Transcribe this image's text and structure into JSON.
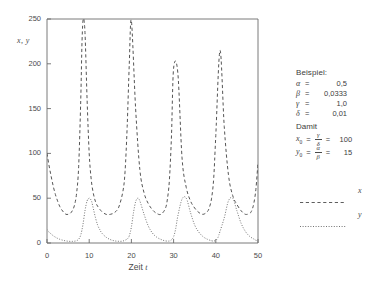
{
  "chart_data": {
    "type": "line",
    "title": "",
    "xlabel": "Zeit t",
    "ylabel": "x, y",
    "xlim": [
      0,
      50
    ],
    "ylim": [
      0,
      250
    ],
    "grid": false,
    "xticks": [
      "0",
      "10",
      "20",
      "30",
      "40",
      "50"
    ],
    "xtick_values": [
      0,
      10,
      20,
      30,
      40,
      50
    ],
    "yticks": [
      "0",
      "50",
      "100",
      "150",
      "200",
      "250"
    ],
    "ytick_values": [
      0,
      50,
      100,
      150,
      200,
      250
    ],
    "legend_position": "right-outside",
    "series": [
      {
        "name": "x",
        "style": "dashed",
        "color": "#555555",
        "description": "Beutepopulation x(t), startet bei 100, Maxima ueber 250 bei t ~ 8, 18, 28, 38, 48",
        "x": [
          0.0,
          0.5,
          1.0,
          1.5,
          2.0,
          2.5,
          3.0,
          3.5,
          4.0,
          4.5,
          5.0,
          5.5,
          6.0,
          6.5,
          7.0,
          7.5,
          8.0,
          8.3,
          8.6,
          9.0,
          9.5,
          10.0,
          10.5,
          11.0,
          11.5,
          12.0,
          13.0,
          14.0,
          15.0,
          16.0,
          17.0,
          18.0,
          18.5,
          19.0,
          19.5,
          20.0,
          21.0,
          22.0,
          23.0,
          24.0,
          25.0,
          26.0,
          27.0,
          28.0,
          28.5,
          29.0,
          29.5,
          30.0,
          31.0,
          32.0,
          33.0,
          34.0,
          35.0,
          36.0,
          37.0,
          38.0,
          38.5,
          39.0,
          39.5,
          40.0,
          41.0,
          42.0,
          43.0,
          44.0,
          45.0,
          46.0,
          47.0,
          48.0,
          48.5,
          49.0,
          49.5,
          50.0
        ],
        "y": [
          100,
          86,
          74,
          63,
          54,
          47,
          41,
          37,
          34,
          32,
          32,
          33,
          36,
          42,
          55,
          85,
          160,
          225,
          250,
          235,
          160,
          100,
          70,
          55,
          46,
          41,
          35,
          32,
          32,
          34,
          40,
          58,
          80,
          130,
          200,
          248,
          150,
          82,
          56,
          44,
          37,
          33,
          32,
          38,
          48,
          70,
          120,
          195,
          190,
          95,
          62,
          47,
          39,
          34,
          32,
          35,
          40,
          50,
          72,
          120,
          215,
          130,
          76,
          53,
          43,
          36,
          32,
          33,
          36,
          44,
          60,
          90
        ]
      },
      {
        "name": "y",
        "style": "dotted",
        "color": "#6a6a6a",
        "description": "Raeuberpopulation y(t), startet bei 15, Maxima ca. 50 bei t ~ 10, 20, 30, 40, 50",
        "x": [
          0.0,
          0.5,
          1.0,
          1.5,
          2.0,
          2.5,
          3.0,
          3.5,
          4.0,
          4.5,
          5.0,
          5.5,
          6.0,
          6.5,
          7.0,
          7.5,
          8.0,
          8.5,
          9.0,
          9.5,
          10.0,
          10.3,
          10.6,
          11.0,
          11.5,
          12.0,
          12.5,
          13.0,
          14.0,
          15.0,
          16.0,
          17.0,
          18.0,
          19.0,
          19.5,
          20.0,
          20.5,
          21.0,
          21.5,
          22.0,
          23.0,
          24.0,
          25.0,
          26.0,
          27.0,
          28.0,
          29.0,
          29.5,
          30.0,
          30.5,
          31.0,
          32.0,
          33.0,
          34.0,
          35.0,
          36.0,
          37.0,
          38.0,
          39.0,
          39.5,
          40.0,
          40.5,
          41.0,
          42.0,
          43.0,
          44.0,
          45.0,
          46.0,
          47.0,
          48.0,
          49.0,
          49.5,
          50.0
        ],
        "y": [
          15,
          12,
          10,
          8,
          6.5,
          5.2,
          4.2,
          3.4,
          2.8,
          2.3,
          2.0,
          1.8,
          1.8,
          2.0,
          2.6,
          4.2,
          9.0,
          20,
          36,
          47,
          50,
          49,
          46,
          38,
          28,
          20,
          15,
          11,
          6.5,
          3.8,
          2.4,
          1.9,
          2.2,
          4.5,
          8.0,
          18,
          34,
          46,
          50,
          47,
          32,
          19,
          11,
          6.5,
          4.0,
          2.4,
          2.2,
          3.6,
          7.0,
          16,
          30,
          49,
          50,
          34,
          20,
          12,
          7.0,
          4.2,
          2.5,
          2.2,
          3.0,
          6.0,
          13,
          28,
          47,
          50,
          36,
          22,
          13,
          7.5,
          4.5,
          3.0,
          2.6
        ]
      }
    ]
  },
  "annotation": {
    "heading": "Beispiel:",
    "parameters": [
      {
        "symbol": "α",
        "equals": "=",
        "value": "0,5"
      },
      {
        "symbol": "β",
        "equals": "=",
        "value": "0,0333"
      },
      {
        "symbol": "γ",
        "equals": "=",
        "value": "1,0"
      },
      {
        "symbol": "δ",
        "equals": "=",
        "value": "0,01"
      }
    ],
    "damit_label": "Damit",
    "initial_values": [
      {
        "variable": "x",
        "subscript": "0",
        "numerator": "γ",
        "denominator": "δ",
        "value": "100"
      },
      {
        "variable": "y",
        "subscript": "0",
        "numerator": "α",
        "denominator": "β",
        "value": "15"
      }
    ]
  },
  "legend": {
    "entries": [
      {
        "label": "x",
        "style": "dashed"
      },
      {
        "label": "y",
        "style": "dotted"
      }
    ]
  },
  "colors": {
    "axis": "#6b6b6b",
    "text": "#3d3d3d",
    "curve_x": "#555555",
    "curve_y": "#6a6a6a",
    "background": "#ffffff"
  }
}
